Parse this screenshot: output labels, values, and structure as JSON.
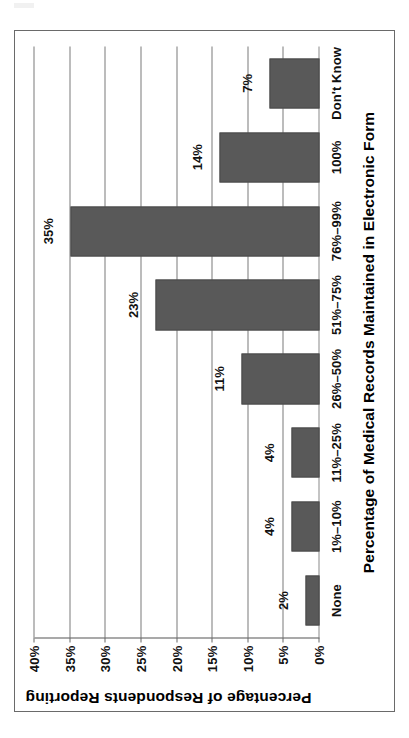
{
  "figure": {
    "frame_border_color": "#6a6a6a",
    "background": "#ffffff"
  },
  "chart_data": {
    "type": "bar",
    "orientation": "vertical",
    "title": "",
    "xlabel": "Percentage of Medical Records Maintained in Electronic Form",
    "ylabel": "Percentage of Respondents Reporting",
    "categories": [
      "None",
      "1%–10%",
      "11%–25%",
      "26%–50%",
      "51%–75%",
      "76%–99%",
      "100%",
      "Don't Know"
    ],
    "values": [
      2,
      4,
      4,
      11,
      23,
      35,
      14,
      7
    ],
    "value_labels": [
      "2%",
      "4%",
      "4%",
      "11%",
      "23%",
      "35%",
      "14%",
      "7%"
    ],
    "ylim": [
      0,
      40
    ],
    "ytick_values": [
      0,
      5,
      10,
      15,
      20,
      25,
      30,
      35,
      40
    ],
    "ytick_labels": [
      "0%",
      "5%",
      "10%",
      "15%",
      "20%",
      "25%",
      "30%",
      "35%",
      "40%"
    ],
    "grid": true,
    "legend": false,
    "bar_color": "#595959",
    "gridline_color": "#7a7a7a"
  }
}
